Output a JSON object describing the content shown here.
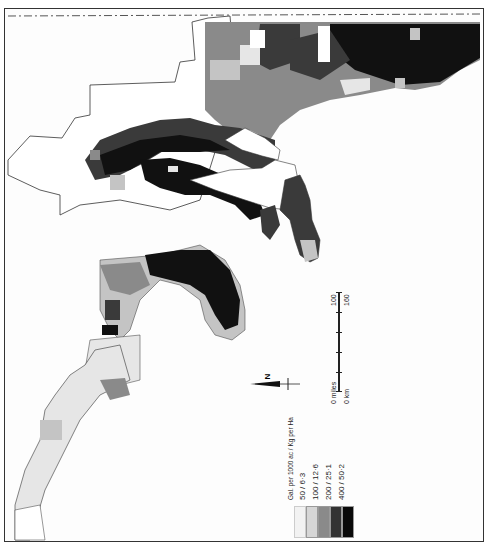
{
  "map": {
    "orientation": "rotated 90 degrees counter-clockwise (north points left)",
    "style": "grayscale choropleth",
    "colors": {
      "class_1": "#e6e6e6",
      "class_2": "#c4c4c4",
      "class_3": "#8a8a8a",
      "class_4": "#3a3a3a",
      "class_5": "#111111",
      "water": "#ffffff",
      "boundary": "#333333"
    }
  },
  "legend": {
    "title": "Gal. per 1000 ac / Kg per Ha",
    "classes": [
      {
        "label": "50 / 6·3",
        "color": "#e6e6e6"
      },
      {
        "label": "100 / 12·6",
        "color": "#c4c4c4"
      },
      {
        "label": "200 / 25·1",
        "color": "#8a8a8a"
      },
      {
        "label": "400 / 50·2",
        "color": "#3a3a3a"
      },
      {
        "label": "",
        "color": "#111111"
      }
    ]
  },
  "scale": {
    "miles_start": "0 miles",
    "miles_end": "100",
    "km_start": "0 km",
    "km_end": "160"
  },
  "north_arrow": {
    "label": "N"
  }
}
